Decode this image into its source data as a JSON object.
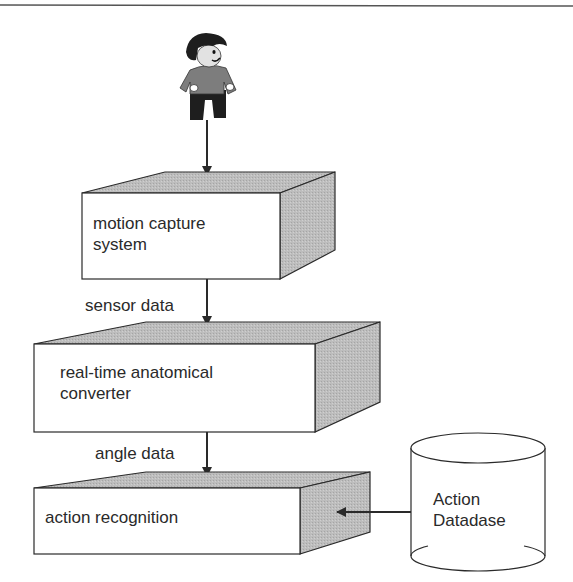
{
  "diagram": {
    "actor": {
      "name": "user figure",
      "icon": "person-icon"
    },
    "boxes": [
      {
        "id": "motion-capture",
        "lines": [
          "motion capture",
          "system"
        ]
      },
      {
        "id": "anatomical-converter",
        "lines": [
          "real-time anatomical",
          "converter"
        ]
      },
      {
        "id": "action-recognition",
        "lines": [
          "action recognition"
        ]
      }
    ],
    "edges": [
      {
        "from": "actor",
        "to": "motion-capture",
        "label": ""
      },
      {
        "from": "motion-capture",
        "to": "anatomical-converter",
        "label": "sensor data"
      },
      {
        "from": "anatomical-converter",
        "to": "action-recognition",
        "label": "angle data"
      },
      {
        "from": "action-database",
        "to": "action-recognition",
        "label": ""
      }
    ],
    "database": {
      "id": "action-database",
      "lines": [
        "Action",
        "Datadase"
      ]
    },
    "colors": {
      "stroke": "#2a2a2a",
      "shade": "#b8b8b8",
      "face": "#ffffff"
    }
  }
}
